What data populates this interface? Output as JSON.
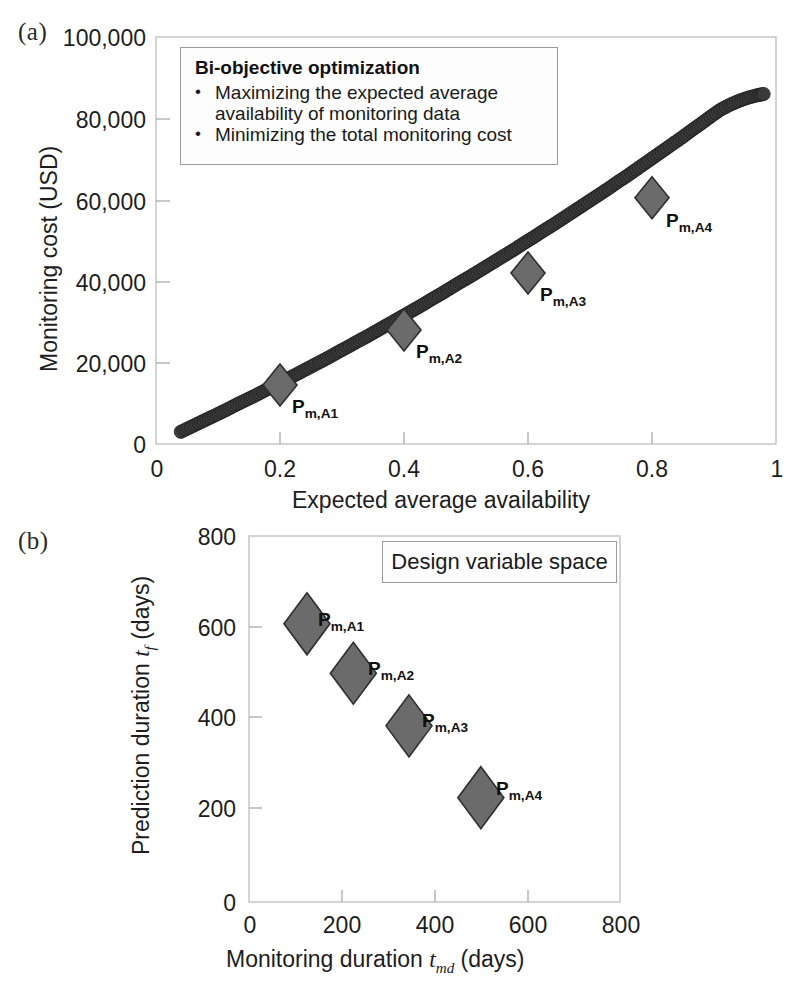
{
  "figure": {
    "panel_a_letter": "(a)",
    "panel_b_letter": "(b)"
  },
  "panel_a": {
    "callout": {
      "title": "Bi-objective optimization",
      "bullet_symbol": "•",
      "bullets": [
        "Maximizing the expected average availability of monitoring data",
        "Minimizing the total monitoring cost"
      ]
    },
    "ylabel": "Monitoring cost (USD)",
    "xlabel": "Expected average availability",
    "yticks": [
      "0",
      "20,000",
      "40,000",
      "60,000",
      "80,000",
      "100,000"
    ],
    "xticks": [
      "0",
      "0.2",
      "0.4",
      "0.6",
      "0.8",
      "1"
    ],
    "point_labels": [
      "P",
      "m,A1",
      "m,A2",
      "m,A3",
      "m,A4"
    ]
  },
  "panel_b": {
    "callout_label": "Design variable space",
    "ylabel_main": "Prediction duration ",
    "ylabel_sym": "t",
    "ylabel_sub": "f",
    "ylabel_unit": " (days)",
    "xlabel_main": "Monitoring duration ",
    "xlabel_sym": "t",
    "xlabel_sub": "md",
    "xlabel_unit": " (days)",
    "yticks": [
      "0",
      "200",
      "400",
      "600",
      "800"
    ],
    "xticks": [
      "0",
      "200",
      "400",
      "600",
      "800"
    ]
  },
  "colors": {
    "marker_fill": "#6b6b6b",
    "marker_stroke": "#2e2e2e",
    "pareto_marker": "#3a3a3a",
    "axis": "#b9b9b9",
    "text": "#1a1a1a"
  },
  "chart_data": [
    {
      "type": "scatter",
      "id": "panel-a",
      "title": "",
      "xlabel": "Expected average availability",
      "ylabel": "Monitoring cost (USD)",
      "xlim": [
        0,
        1
      ],
      "ylim": [
        0,
        100000
      ],
      "xticks": [
        0,
        0.2,
        0.4,
        0.6,
        0.8,
        1
      ],
      "yticks": [
        0,
        20000,
        40000,
        60000,
        80000,
        100000
      ],
      "grid": false,
      "legend": "none",
      "series": [
        {
          "name": "Pareto front",
          "marker": "circle",
          "color": "#3a3a3a",
          "x": [
            0.04,
            0.055,
            0.07,
            0.085,
            0.1,
            0.115,
            0.13,
            0.145,
            0.16,
            0.175,
            0.19,
            0.205,
            0.22,
            0.235,
            0.25,
            0.265,
            0.28,
            0.295,
            0.31,
            0.325,
            0.34,
            0.355,
            0.37,
            0.385,
            0.4,
            0.415,
            0.43,
            0.445,
            0.46,
            0.475,
            0.49,
            0.505,
            0.52,
            0.535,
            0.55,
            0.565,
            0.58,
            0.595,
            0.61,
            0.625,
            0.64,
            0.655,
            0.67,
            0.685,
            0.7,
            0.715,
            0.73,
            0.745,
            0.76,
            0.775,
            0.79,
            0.805,
            0.82,
            0.835,
            0.85,
            0.865,
            0.88,
            0.895,
            0.91,
            0.925,
            0.94,
            0.955,
            0.97,
            0.98
          ],
          "y": [
            3000,
            4100,
            5200,
            6300,
            7400,
            8500,
            9700,
            10800,
            11900,
            13100,
            14300,
            15400,
            16600,
            17800,
            19000,
            20200,
            21400,
            22700,
            23900,
            25200,
            26400,
            27700,
            29000,
            30300,
            31600,
            32900,
            34200,
            35600,
            36900,
            38300,
            39700,
            41000,
            42400,
            43800,
            45200,
            46600,
            48000,
            49500,
            50900,
            52400,
            53800,
            55300,
            56800,
            58300,
            59800,
            61300,
            62800,
            64400,
            65900,
            67500,
            69100,
            70700,
            72300,
            73900,
            75500,
            77200,
            78800,
            80500,
            82100,
            83300,
            84300,
            85100,
            85700,
            86000
          ]
        },
        {
          "name": "Selected solutions",
          "marker": "diamond",
          "color": "#6b6b6b",
          "points": [
            {
              "label": "Pm,A1",
              "x": 0.2,
              "y": 14500
            },
            {
              "label": "Pm,A2",
              "x": 0.4,
              "y": 28000
            },
            {
              "label": "Pm,A3",
              "x": 0.6,
              "y": 42000
            },
            {
              "label": "Pm,A4",
              "x": 0.8,
              "y": 60500
            }
          ]
        }
      ],
      "annotations": [
        "Bi-objective optimization",
        "Maximizing the expected average availability of monitoring data",
        "Minimizing the total monitoring cost"
      ]
    },
    {
      "type": "scatter",
      "id": "panel-b",
      "title": "Design variable space",
      "xlabel": "Monitoring duration t_md (days)",
      "ylabel": "Prediction duration t_f (days)",
      "xlim": [
        0,
        800
      ],
      "ylim": [
        0,
        800
      ],
      "xticks": [
        0,
        200,
        400,
        600,
        800
      ],
      "yticks": [
        0,
        200,
        400,
        600,
        800
      ],
      "grid": false,
      "legend": "none",
      "series": [
        {
          "name": "Selected solutions",
          "marker": "diamond",
          "color": "#6b6b6b",
          "points": [
            {
              "label": "Pm,A1",
              "x": 125,
              "y": 608
            },
            {
              "label": "Pm,A2",
              "x": 225,
              "y": 500
            },
            {
              "label": "Pm,A3",
              "x": 345,
              "y": 385
            },
            {
              "label": "Pm,A4",
              "x": 500,
              "y": 228
            }
          ]
        }
      ]
    }
  ]
}
